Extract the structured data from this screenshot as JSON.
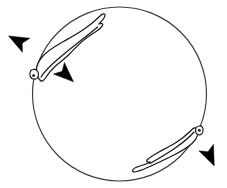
{
  "figure": {
    "background_color": "#ffffff",
    "width": 227,
    "height": 188,
    "line_color": "#1a1a1a",
    "arrow_color": "#000000",
    "track_color": "#3b3b3b"
  },
  "track": {
    "name": "circular-track",
    "center_x": 119.5,
    "center_y": 94,
    "radius": 87,
    "stroke_width": 1.15
  },
  "organisms": [
    {
      "id": "organism-upper-left",
      "label": "",
      "head_x": 34,
      "head_y": 73,
      "tail_x": 99,
      "tail_y": 16,
      "orientation": "head at lower-left on track, tail curving to upper-right",
      "outline": "M 40 78 C 36 70 38 60 47 52 C 56 44 66 40 76 34 C 86 28 94 22 100 16 C 104 12 106 13 104 17 C 101 22 100 26 97 30 C 102 28 104 30 100 34 C 94 40 86 46 78 52 C 70 58 62 64 54 70 C 48 75 45 81 40 78 Z",
      "outline_inner": "M 41 76 C 44 72 50 66 58 60 C 66 54 76 47 84 41 C 90 36 95 32 98 29"
    },
    {
      "id": "organism-lower-right",
      "label": "",
      "head_x": 199,
      "head_y": 132,
      "tail_x": 134,
      "tail_y": 172,
      "orientation": "head at upper-right on track, tail extending to lower-left",
      "outline": "M 195 135 C 190 142 182 148 173 154 C 164 160 154 166 146 170 C 140 173 136 174 134 172 C 132 170 135 169 139 168 C 144 167 149 165 155 162 C 150 163 146 162 149 159 C 156 154 165 149 174 144 C 183 139 190 134 195 135 Z",
      "outline_inner": "M 193 137 C 188 142 180 148 171 153 C 162 159 153 164 147 167"
    }
  ],
  "arrows": [
    {
      "id": "arrow-upper-left-outward",
      "direction": "up-left",
      "angle_deg": 208,
      "tip_x": 8,
      "tip_y": 31,
      "length": 24,
      "meaning": "movement direction away from track"
    },
    {
      "id": "arrow-upper-left-tangential",
      "direction": "down-right",
      "angle_deg": 43,
      "tip_x": 76,
      "tip_y": 84,
      "length": 24,
      "meaning": "movement direction along track"
    },
    {
      "id": "arrow-lower-right-outward",
      "direction": "down-right",
      "angle_deg": 66,
      "tip_x": 219,
      "tip_y": 167,
      "length": 24,
      "meaning": "movement direction away from track"
    }
  ]
}
